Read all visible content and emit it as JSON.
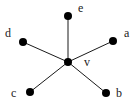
{
  "diagram": {
    "type": "star-graph",
    "center": "v",
    "nodes": [
      {
        "id": "v",
        "label": "v",
        "x": 68,
        "y": 62,
        "lx": 84,
        "ly": 66
      },
      {
        "id": "e",
        "label": "e",
        "x": 68,
        "y": 16,
        "lx": 78,
        "ly": 12
      },
      {
        "id": "d",
        "label": "d",
        "x": 23,
        "y": 42,
        "lx": 5,
        "ly": 37
      },
      {
        "id": "a",
        "label": "a",
        "x": 113,
        "y": 41,
        "lx": 124,
        "ly": 37
      },
      {
        "id": "c",
        "label": "c",
        "x": 30,
        "y": 92,
        "lx": 11,
        "ly": 97
      },
      {
        "id": "b",
        "label": "b",
        "x": 106,
        "y": 93,
        "lx": 116,
        "ly": 97
      }
    ],
    "edges": [
      {
        "from": "v",
        "to": "e"
      },
      {
        "from": "v",
        "to": "d"
      },
      {
        "from": "v",
        "to": "a"
      },
      {
        "from": "v",
        "to": "c"
      },
      {
        "from": "v",
        "to": "b"
      }
    ],
    "colors": {
      "node": "#000000",
      "edge": "#1a1a1a",
      "label": "#222222",
      "background": "#ffffff"
    }
  }
}
